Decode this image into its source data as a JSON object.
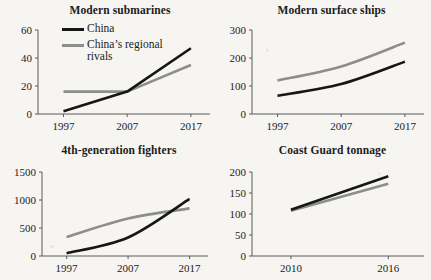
{
  "figure": {
    "background_color": "#f6f5f1",
    "series_colors": {
      "china": "#161616",
      "rivals": "#8d8d8d"
    }
  },
  "legend": {
    "position": "top-left-panel",
    "entries": [
      {
        "key": "china",
        "label": "China",
        "color": "#161616"
      },
      {
        "key": "rivals",
        "label": "China’s regional rivals",
        "color": "#8d8d8d"
      }
    ]
  },
  "chart_data": [
    {
      "id": "modern-submarines",
      "type": "line",
      "title": "Modern submarines",
      "xlabel": "",
      "ylabel": "",
      "x": [
        1997,
        2007,
        2017
      ],
      "xticklabels": [
        "1997",
        "2007",
        "2017"
      ],
      "xlim": [
        1993,
        2020
      ],
      "ylim": [
        0,
        60
      ],
      "yticks": [
        0,
        20,
        40,
        60
      ],
      "yticklabels": [
        "0",
        "20",
        "40",
        "60"
      ],
      "grid": false,
      "series": [
        {
          "name": "China",
          "key": "china",
          "values": [
            2,
            16,
            47
          ]
        },
        {
          "name": "China’s regional rivals",
          "key": "rivals",
          "values": [
            16,
            16,
            35
          ]
        }
      ]
    },
    {
      "id": "modern-surface-ships",
      "type": "line",
      "title": "Modern surface ships",
      "xlabel": "",
      "ylabel": "",
      "x": [
        1997,
        2007,
        2017
      ],
      "xticklabels": [
        "1997",
        "2007",
        "2017"
      ],
      "xlim": [
        1993,
        2020
      ],
      "ylim": [
        0,
        300
      ],
      "yticks": [
        0,
        100,
        200,
        300
      ],
      "yticklabels": [
        "0",
        "100",
        "200",
        "300"
      ],
      "grid": false,
      "series": [
        {
          "name": "China",
          "key": "china",
          "values": [
            65,
            107,
            187
          ]
        },
        {
          "name": "China’s regional rivals",
          "key": "rivals",
          "values": [
            120,
            170,
            255
          ]
        }
      ]
    },
    {
      "id": "4th-generation-fighters",
      "type": "line",
      "title": "4th-generation fighters",
      "xlabel": "",
      "ylabel": "",
      "x": [
        1997,
        2007,
        2017
      ],
      "xticklabels": [
        "1997",
        "2007",
        "2017"
      ],
      "xlim": [
        1993,
        2020
      ],
      "ylim": [
        0,
        1500
      ],
      "yticks": [
        0,
        500,
        1000,
        1500
      ],
      "yticklabels": [
        "0",
        "500",
        "1000",
        "1500"
      ],
      "grid": false,
      "series": [
        {
          "name": "China",
          "key": "china",
          "values": [
            50,
            330,
            1020
          ]
        },
        {
          "name": "China’s regional rivals",
          "key": "rivals",
          "values": [
            340,
            670,
            850
          ]
        }
      ]
    },
    {
      "id": "coast-guard-tonnage",
      "type": "line",
      "title": "Coast Guard tonnage",
      "xlabel": "",
      "ylabel": "",
      "x": [
        2010,
        2016
      ],
      "xticklabels": [
        "2010",
        "2016"
      ],
      "xlim": [
        2007.6,
        2018.2
      ],
      "ylim": [
        0,
        200
      ],
      "yticks": [
        0,
        50,
        100,
        150,
        200
      ],
      "yticklabels": [
        "0",
        "50",
        "100",
        "150",
        "200"
      ],
      "grid": false,
      "series": [
        {
          "name": "China",
          "key": "china",
          "values": [
            110,
            190
          ]
        },
        {
          "name": "China’s regional rivals",
          "key": "rivals",
          "values": [
            108,
            172
          ]
        }
      ]
    }
  ]
}
